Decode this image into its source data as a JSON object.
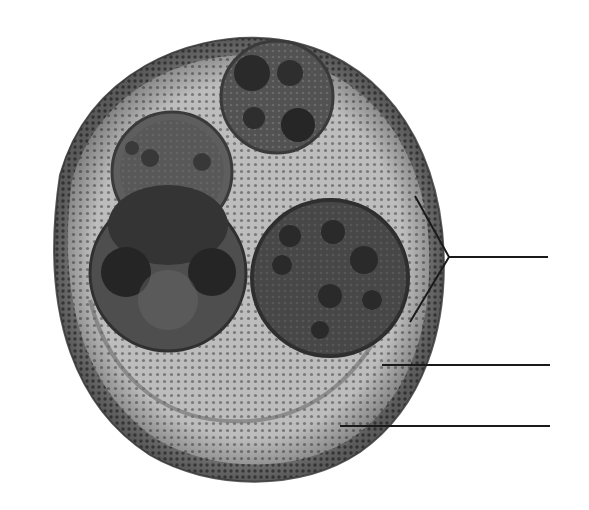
{
  "diagram": {
    "type": "biological-illustration",
    "labels": [],
    "colors": {
      "background": "#ffffff",
      "outer_wall": "#6e6e6e",
      "cytoplasm": "#b9b9b9",
      "inner_body": "#4a4a4a",
      "nucleus_spot": "#262626",
      "leader_line": "#1a1a1a"
    },
    "outer_body": {
      "cx": 244,
      "cy": 259,
      "rx": 201,
      "ry": 224
    },
    "inner_bodies": [
      {
        "name": "top-body",
        "cx": 277,
        "cy": 97,
        "r": 56,
        "spots": 4
      },
      {
        "name": "upper-left-body",
        "cx": 172,
        "cy": 170,
        "r": 60,
        "spots": 3
      },
      {
        "name": "lower-left-body",
        "cx": 168,
        "cy": 273,
        "r": 78,
        "spots": 2
      },
      {
        "name": "right-body",
        "cx": 330,
        "cy": 278,
        "r": 78,
        "spots": 7
      }
    ],
    "leader_lines": [
      {
        "name": "bracket-line",
        "apex": [
          449,
          257
        ],
        "top": [
          415,
          196
        ],
        "bottom": [
          410,
          322
        ],
        "end_x": 548,
        "y": 257
      },
      {
        "name": "middle-line",
        "x1": 382,
        "x2": 550,
        "y": 365
      },
      {
        "name": "bottom-line",
        "x1": 340,
        "x2": 550,
        "y": 426
      }
    ]
  }
}
